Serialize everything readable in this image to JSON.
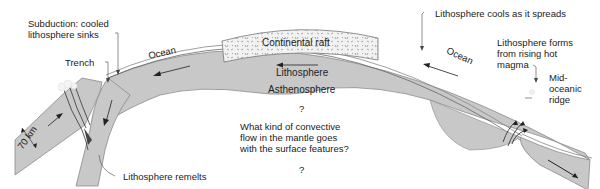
{
  "diagram": {
    "colors": {
      "plate": "#c8c8c8",
      "plate_stroke": "#8a8a8a",
      "continent": "#efefef",
      "ocean_layer": "#ffffff",
      "ink": "#222222"
    },
    "labels": {
      "subduction": "Subduction: cooled lithosphere sinks",
      "trench": "Trench",
      "ocean_left": "Ocean",
      "continental_raft": "Continental raft",
      "lithosphere": "Lithosphere",
      "asthenosphere": "Asthenosphere",
      "question_top": "?",
      "question_text": "What kind of convective flow in the mantle goes with the surface features?",
      "question_bottom": "?",
      "lithosphere_cools": "Lithosphere cools as it spreads",
      "ocean_right": "Ocean",
      "lithosphere_forms": "Lithosphere forms from rising hot magma",
      "ridge": "Mid-oceanic ridge",
      "thickness": "70 km",
      "remelts": "Lithosphere remelts"
    }
  }
}
